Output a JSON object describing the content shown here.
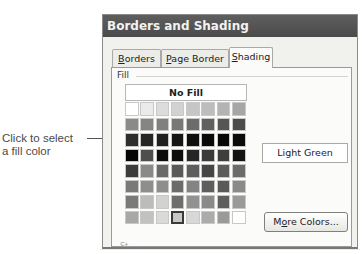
{
  "callout": {
    "line1": "Click to select",
    "line2": "a fill color"
  },
  "dialog": {
    "title": "Borders and Shading",
    "tabs": [
      {
        "label_prefix": "",
        "accesskey": "B",
        "label_rest": "orders",
        "active": false
      },
      {
        "label_prefix": "",
        "accesskey": "P",
        "label_rest": "age Border",
        "active": false
      },
      {
        "label_prefix": "",
        "accesskey": "S",
        "label_rest": "hading",
        "active": true
      }
    ],
    "fill": {
      "section_label": "Fill",
      "no_fill_label": "No Fill",
      "palette_rows": [
        [
          "#ffffff",
          "#ebebeb",
          "#dcdcdc",
          "#d2d2d2",
          "#c6c6c6",
          "#bdbdbd",
          "#b3b3b3",
          "#a6a6a6"
        ],
        [
          "#8a8a8a",
          "#858585",
          "#808080",
          "#787878",
          "#6c6c6c",
          "#606060",
          "#565656",
          "#4c4c4c"
        ],
        [
          "#2e2e2e",
          "#262626",
          "#202020",
          "#161616",
          "#0e0e0e",
          "#0a0a0a",
          "#080808",
          "#0c0c0c"
        ],
        [
          "#060606",
          "#4e4e4e",
          "#0c0c0c",
          "#0e0e0e",
          "#262626",
          "#3a3a3a",
          "#3e3e3e",
          "#141414"
        ],
        [
          "#3c3c3c",
          "#8a8a8a",
          "#6a6a6a",
          "#5a5a5a",
          "#5e5e5e",
          "#464646",
          "#5c5c5c",
          "#6c6c6c"
        ],
        [
          "#7a7a7a",
          "#8e8e8e",
          "#8e8e8e",
          "#6c6c6c",
          "#848484",
          "#5e5e5e",
          "#5a5a5a",
          "#8a8a8a"
        ],
        [
          "#7a7a7a",
          "#bcbcbc",
          "#d2d2d2",
          "#6e6e6e",
          "#929292",
          "#8a8a8a",
          "#5e5e5e",
          "#9a9a9a"
        ],
        [
          "#a8a8a8",
          "#c2c2c2",
          "#dadada",
          "#c8c8c8",
          "#d8d8d8",
          "#ababab",
          "#9a9a9a",
          "#ffffff"
        ]
      ],
      "selected_cell": {
        "row": 7,
        "col": 3
      },
      "selected_color_name": "Light Green",
      "more_colors": {
        "prefix": "M",
        "accesskey": "o",
        "rest": "re Colors..."
      }
    },
    "truncated_label": "St..."
  }
}
